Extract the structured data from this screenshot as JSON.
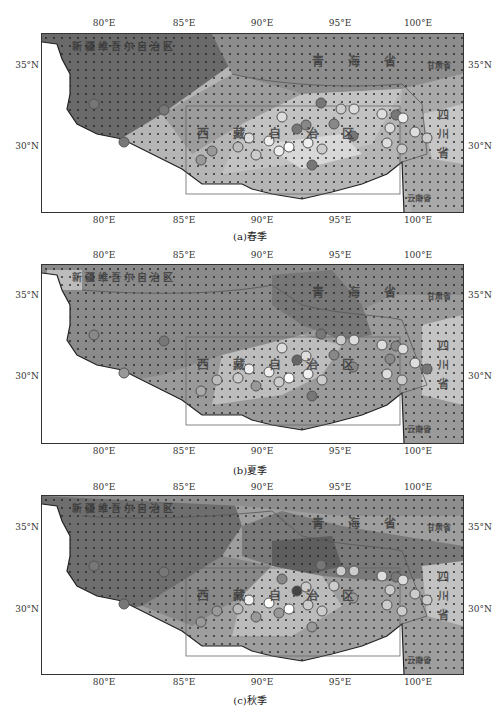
{
  "figure": {
    "lon_ticks": [
      "80°E",
      "85°E",
      "90°E",
      "95°E",
      "100°E"
    ],
    "lat_ticks": [
      "35°N",
      "30°N"
    ],
    "panels": [
      {
        "id": "a",
        "caption": "(a)春季",
        "regions": {
          "xinjiang": "新疆维吾尔自治区",
          "qinghai": "青 海 省",
          "gansu": "甘肃省",
          "xizang": "西 藏 自 治 区",
          "sichuan": "四川省",
          "yunnan": "云南省"
        }
      },
      {
        "id": "b",
        "caption": "(b)夏季",
        "regions": {
          "xinjiang": "新疆维吾尔自治区",
          "qinghai": "青 海 省",
          "gansu": "甘肃省",
          "xizang": "西 藏 自 治 区",
          "sichuan": "四川省",
          "yunnan": "云南省"
        }
      },
      {
        "id": "c",
        "caption": "(c)秋季",
        "regions": {
          "xinjiang": "新疆维吾尔自治区",
          "qinghai": "青 海 省",
          "gansu": "甘肃省",
          "xizang": "西 藏 自 治 区",
          "sichuan": "四川省",
          "yunnan": "云南省"
        }
      }
    ]
  },
  "colors": {
    "darkest": "#5a5a5a",
    "dark": "#7a7a7a",
    "mid": "#999999",
    "light": "#b8b8b8",
    "lightest": "#d4d4d4",
    "outside": "#ffffff",
    "border": "#333333"
  }
}
